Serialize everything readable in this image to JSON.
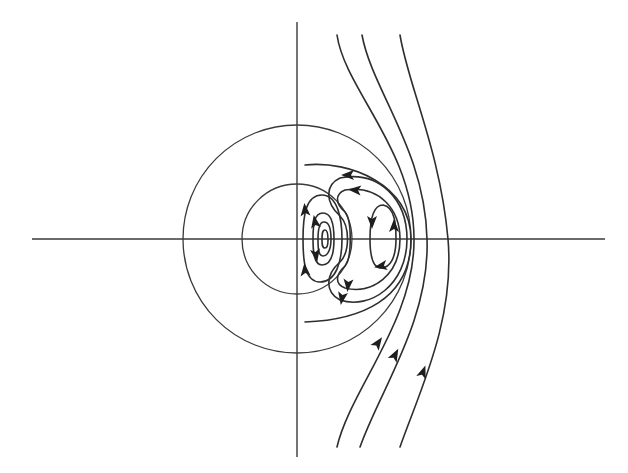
{
  "diagram": {
    "title": "",
    "colors": {
      "background": "#ffffff",
      "line": "#2e2e2e",
      "arrow": "#1e1e1e"
    },
    "axes": {
      "horizontal": {
        "x1": 32,
        "y1": 239,
        "x2": 605,
        "y2": 239
      },
      "vertical": {
        "x1": 297,
        "y1": 22,
        "x2": 297,
        "y2": 457
      }
    },
    "circles": [
      {
        "name": "outer-circle",
        "cx": 297,
        "cy": 239,
        "r": 114
      },
      {
        "name": "inner-circle",
        "cx": 297,
        "cy": 239,
        "r": 55
      }
    ],
    "streamlines": [
      {
        "name": "outer-streamline-1",
        "d": "M400,35 C408,85 440,150 448,239 C455,320 420,390 400,447"
      },
      {
        "name": "outer-streamline-2",
        "d": "M362,35 C372,90 425,150 427,239 C430,320 380,390 360,447"
      },
      {
        "name": "outer-streamline-3",
        "d": "M337,35 C345,90 414,150 414,239 C415,320 350,390 337,447"
      },
      {
        "name": "separatrix-outer",
        "d": "M305,165 C350,160 411,185 411,239 C411,300 360,320 305,322"
      },
      {
        "name": "recirc-loop-large",
        "d": "M340,178 C380,170 407,200 407,239 C407,285 370,310 340,300 C325,292 325,275 340,262 C350,252 350,226 340,216 C325,202 325,185 340,178 Z"
      },
      {
        "name": "recirc-loop-mid",
        "d": "M345,190 C380,185 400,210 400,239 C400,275 372,295 345,288 C335,284 335,275 345,266 C352,258 352,220 345,212 C335,203 335,194 345,190 Z"
      },
      {
        "name": "right-vortex",
        "d": "M383,205 C395,207 396,225 396,239 C396,258 390,268 381,268 C372,268 370,255 370,239 C370,220 373,205 383,205 Z"
      },
      {
        "name": "left-vortex-outer",
        "d": "M322,195 C338,195 342,220 342,239 C342,262 336,282 320,282 C305,282 303,262 303,239 C303,215 306,195 322,195 Z"
      },
      {
        "name": "left-vortex-mid",
        "d": "M323,213 C333,213 334,228 334,239 C334,253 331,265 322,265 C314,265 313,252 313,239 C313,225 314,213 323,213 Z"
      },
      {
        "name": "left-vortex-inner",
        "d": "M324,222 C330,222 331,232 331,239 C331,249 328,256 323,256 C318,256 318,247 318,239 C318,230 319,222 324,222 Z"
      },
      {
        "name": "left-vortex-core",
        "d": "M325,230 C328,230 328,236 328,240 C328,245 327,248 325,248 C322,248 322,244 322,240 C322,235 322,230 325,230 Z"
      }
    ],
    "arrows": [
      {
        "name": "arrow-up-outer-1",
        "x": 423,
        "y": 372,
        "angle": -70
      },
      {
        "name": "arrow-up-outer-2",
        "x": 395,
        "y": 355,
        "angle": -62
      },
      {
        "name": "arrow-up-outer-3",
        "x": 378,
        "y": 343,
        "angle": -55
      },
      {
        "name": "arrow-left-top-1",
        "x": 348,
        "y": 175,
        "angle": 180
      },
      {
        "name": "arrow-left-top-2",
        "x": 355,
        "y": 190,
        "angle": 185
      },
      {
        "name": "arrow-down-bottom-1",
        "x": 342,
        "y": 298,
        "angle": 100
      },
      {
        "name": "arrow-down-bottom-2",
        "x": 348,
        "y": 285,
        "angle": 95
      },
      {
        "name": "arrow-up-left-vortex-1",
        "x": 305,
        "y": 210,
        "angle": -95
      },
      {
        "name": "arrow-up-left-vortex-2",
        "x": 305,
        "y": 270,
        "angle": -95
      },
      {
        "name": "arrow-up-left-vortex-3",
        "x": 315,
        "y": 222,
        "angle": -100
      },
      {
        "name": "arrow-down-left-vortex-4",
        "x": 316,
        "y": 255,
        "angle": 80
      },
      {
        "name": "arrow-down-right-vortex",
        "x": 372,
        "y": 222,
        "angle": 90
      },
      {
        "name": "arrow-up-right-vortex",
        "x": 394,
        "y": 226,
        "angle": -90
      },
      {
        "name": "arrow-left-right-vortex",
        "x": 381,
        "y": 266,
        "angle": 170
      }
    ]
  }
}
